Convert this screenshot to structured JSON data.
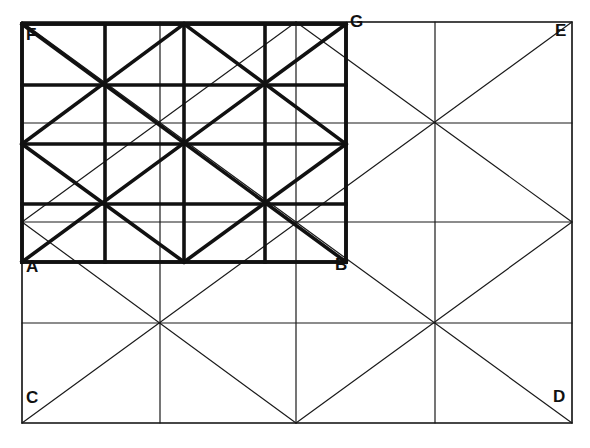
{
  "colors": {
    "ink": "#111111",
    "background": "#ffffff"
  },
  "labels": [
    {
      "text": "F",
      "x": 26,
      "y": 40
    },
    {
      "text": "G",
      "x": 350,
      "y": 27
    },
    {
      "text": "E",
      "x": 555,
      "y": 36
    },
    {
      "text": "A",
      "x": 26,
      "y": 272
    },
    {
      "text": "B",
      "x": 335,
      "y": 270
    },
    {
      "text": "C",
      "x": 26,
      "y": 403
    },
    {
      "text": "D",
      "x": 553,
      "y": 402
    }
  ],
  "outer_rect": {
    "name": "CDEF-outer",
    "x1": 22,
    "y1": 22,
    "x2": 572,
    "y2": 423
  },
  "outer_grid": {
    "verticals": [
      22,
      160,
      296,
      435,
      572
    ],
    "horizontals": [
      22,
      123,
      222,
      323,
      423
    ]
  },
  "outer_diagonals": [
    [
      22,
      423,
      572,
      22
    ],
    [
      22,
      222,
      296,
      22
    ],
    [
      296,
      423,
      572,
      222
    ],
    [
      22,
      222,
      296,
      423
    ],
    [
      296,
      22,
      572,
      222
    ],
    [
      296,
      222,
      572,
      423
    ],
    [
      22,
      22,
      296,
      222
    ]
  ],
  "inner_rect": {
    "name": "ABGF-bold",
    "x1": 22,
    "y1": 24,
    "x2": 346,
    "y2": 262
  },
  "inner_grid": {
    "verticals": [
      22,
      105,
      184,
      265,
      346
    ],
    "horizontals": [
      24,
      85,
      144,
      204,
      262
    ]
  },
  "inner_diagonals": [
    [
      22,
      24,
      346,
      262
    ],
    [
      22,
      262,
      346,
      24
    ],
    [
      22,
      144,
      184,
      24
    ],
    [
      184,
      24,
      346,
      144
    ],
    [
      22,
      144,
      184,
      262
    ],
    [
      184,
      262,
      346,
      144
    ]
  ]
}
